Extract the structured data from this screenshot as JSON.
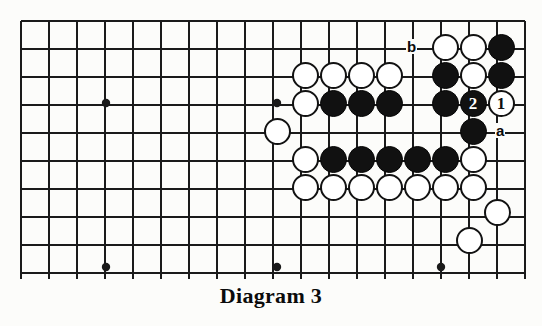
{
  "figure": {
    "caption": "Diagram 3",
    "type": "go-board-diagram",
    "board": {
      "origin_x": 21,
      "origin_y": 21,
      "spacing": 28,
      "cols": 19,
      "rows": 10,
      "right_edge_x": 525,
      "line_color": "#1a1a1a",
      "background_color": "#fcfcfa",
      "star_points": [
        {
          "x": 106,
          "y": 103
        },
        {
          "x": 277,
          "y": 103
        },
        {
          "x": 106,
          "y": 267
        },
        {
          "x": 277,
          "y": 267
        },
        {
          "x": 441,
          "y": 267
        }
      ]
    },
    "stones": [
      {
        "color": "white",
        "x": 445,
        "y": 47,
        "label": ""
      },
      {
        "color": "white",
        "x": 473,
        "y": 47,
        "label": ""
      },
      {
        "color": "black",
        "x": 501,
        "y": 47,
        "label": ""
      },
      {
        "color": "white",
        "x": 305,
        "y": 75,
        "label": ""
      },
      {
        "color": "white",
        "x": 333,
        "y": 75,
        "label": ""
      },
      {
        "color": "white",
        "x": 361,
        "y": 75,
        "label": ""
      },
      {
        "color": "white",
        "x": 389,
        "y": 75,
        "label": ""
      },
      {
        "color": "black",
        "x": 445,
        "y": 75,
        "label": ""
      },
      {
        "color": "white",
        "x": 473,
        "y": 75,
        "label": ""
      },
      {
        "color": "black",
        "x": 501,
        "y": 75,
        "label": ""
      },
      {
        "color": "white",
        "x": 305,
        "y": 103,
        "label": ""
      },
      {
        "color": "black",
        "x": 333,
        "y": 103,
        "label": ""
      },
      {
        "color": "black",
        "x": 361,
        "y": 103,
        "label": ""
      },
      {
        "color": "black",
        "x": 389,
        "y": 103,
        "label": ""
      },
      {
        "color": "black",
        "x": 445,
        "y": 103,
        "label": ""
      },
      {
        "color": "black",
        "x": 473,
        "y": 103,
        "label": "2"
      },
      {
        "color": "white",
        "x": 501,
        "y": 103,
        "label": "1"
      },
      {
        "color": "white",
        "x": 277,
        "y": 131,
        "label": ""
      },
      {
        "color": "black",
        "x": 473,
        "y": 131,
        "label": ""
      },
      {
        "color": "white",
        "x": 305,
        "y": 159,
        "label": ""
      },
      {
        "color": "black",
        "x": 333,
        "y": 159,
        "label": ""
      },
      {
        "color": "black",
        "x": 361,
        "y": 159,
        "label": ""
      },
      {
        "color": "black",
        "x": 389,
        "y": 159,
        "label": ""
      },
      {
        "color": "black",
        "x": 417,
        "y": 159,
        "label": ""
      },
      {
        "color": "black",
        "x": 445,
        "y": 159,
        "label": ""
      },
      {
        "color": "white",
        "x": 473,
        "y": 159,
        "label": ""
      },
      {
        "color": "white",
        "x": 305,
        "y": 187,
        "label": ""
      },
      {
        "color": "white",
        "x": 333,
        "y": 187,
        "label": ""
      },
      {
        "color": "white",
        "x": 361,
        "y": 187,
        "label": ""
      },
      {
        "color": "white",
        "x": 389,
        "y": 187,
        "label": ""
      },
      {
        "color": "white",
        "x": 417,
        "y": 187,
        "label": ""
      },
      {
        "color": "white",
        "x": 445,
        "y": 187,
        "label": ""
      },
      {
        "color": "white",
        "x": 473,
        "y": 187,
        "label": ""
      },
      {
        "color": "white",
        "x": 497,
        "y": 212,
        "label": ""
      },
      {
        "color": "white",
        "x": 469,
        "y": 240,
        "label": ""
      }
    ],
    "markers": [
      {
        "text": "b",
        "x": 412,
        "y": 47
      },
      {
        "text": "a",
        "x": 501,
        "y": 131
      }
    ],
    "move_numbers": [
      {
        "number": "1",
        "color": "white",
        "x": 501,
        "y": 103
      },
      {
        "number": "2",
        "color": "black",
        "x": 473,
        "y": 103
      }
    ]
  }
}
